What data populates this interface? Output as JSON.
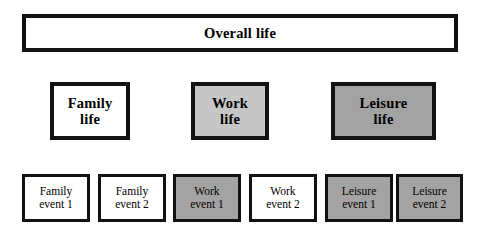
{
  "diagram": {
    "rows": {
      "overall": {
        "label": "Overall life",
        "fill": "#ffffff",
        "border": "#121212"
      },
      "domains": [
        {
          "name": "family-life",
          "line1": "Family",
          "line2": "life",
          "fill": "#ffffff"
        },
        {
          "name": "work-life",
          "line1": "Work",
          "line2": "life",
          "fill": "#c6c6c6"
        },
        {
          "name": "leisure-life",
          "line1": "Leisure",
          "line2": "life",
          "fill": "#a3a3a3"
        }
      ],
      "events": [
        {
          "name": "family-event-1",
          "line1": "Family",
          "line2": "event 1",
          "fill": "#ffffff"
        },
        {
          "name": "family-event-2",
          "line1": "Family",
          "line2": "event 2",
          "fill": "#ffffff"
        },
        {
          "name": "work-event-1",
          "line1": "Work",
          "line2": "event 1",
          "fill": "#a3a3a3"
        },
        {
          "name": "work-event-2",
          "line1": "Work",
          "line2": "event 2",
          "fill": "#ffffff"
        },
        {
          "name": "leisure-event-1",
          "line1": "Leisure",
          "line2": "event 1",
          "fill": "#a3a3a3"
        },
        {
          "name": "leisure-event-2",
          "line1": "Leisure",
          "line2": "event 2",
          "fill": "#a3a3a3"
        }
      ]
    },
    "colors": {
      "background": "#ffffff",
      "border": "#121212",
      "fill_white": "#ffffff",
      "fill_light_gray": "#c6c6c6",
      "fill_mid_gray": "#a3a3a3",
      "text": "#000000"
    }
  }
}
